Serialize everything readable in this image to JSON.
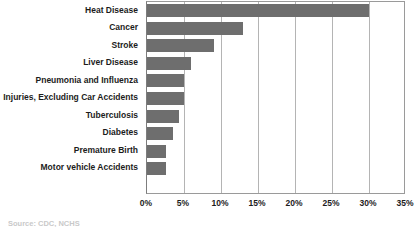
{
  "caption": "Source:  CDC, NCHS",
  "chart_data": {
    "type": "bar",
    "orientation": "horizontal",
    "title": "",
    "subtitle": "",
    "xlabel": "",
    "ylabel": "",
    "grid": true,
    "legend": false,
    "xlim": [
      0,
      35
    ],
    "xticks": [
      0,
      5,
      10,
      15,
      20,
      25,
      30,
      35
    ],
    "xtick_labels": [
      "0%",
      "5%",
      "10%",
      "15%",
      "20%",
      "25%",
      "30%",
      "35%"
    ],
    "categories": [
      "Heat Disease",
      "Cancer",
      "Stroke",
      "Liver Disease",
      "Pneumonia and Influenza",
      "Injuries, Excluding Car Accidents",
      "Tuberculosis",
      "Diabetes",
      "Premature Birth",
      "Motor vehicle Accidents"
    ],
    "values": [
      30,
      13,
      9,
      6,
      5,
      5,
      4.3,
      3.5,
      2.5,
      2.5
    ],
    "bar_color": "#6e6e6e",
    "plot_border_color": "#9a9a9a",
    "gridline_color": "#b4b4b4"
  }
}
